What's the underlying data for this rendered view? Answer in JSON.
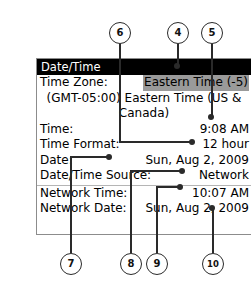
{
  "panel": {
    "title": "Date/Time",
    "rows": [
      {
        "label": "Time Zone:",
        "value": "Eastern Time (-5)",
        "highlighted": true
      },
      {
        "wrap_text": "(GMT-05:00) Eastern Time (US & Canada)"
      },
      {
        "label": "Time:",
        "value": "9:08 AM"
      },
      {
        "label": "Time Format:",
        "value": "12 hour"
      },
      {
        "label": "Date:",
        "value": "Sun, Aug 2, 2009"
      },
      {
        "label": "Date/Time Source:",
        "value": "Network"
      },
      {
        "divider": true
      },
      {
        "label": "Network Time:",
        "value": "10:07 AM"
      },
      {
        "label": "Network Date:",
        "value": "Sun, Aug 2, 2009"
      }
    ]
  },
  "callouts": [
    {
      "number": "6",
      "target": "time-format-value"
    },
    {
      "number": "4",
      "target": "panel-title-bar"
    },
    {
      "number": "5",
      "target": "time-zone-description"
    },
    {
      "number": "7",
      "target": "date-time-source-label"
    },
    {
      "number": "8",
      "target": "date-value"
    },
    {
      "number": "9",
      "target": "network-time-value"
    },
    {
      "number": "10",
      "target": "network-date-value"
    }
  ],
  "colors": {
    "title_bar_bg": "#000000",
    "title_bar_text": "#ffffff",
    "highlight_bg": "#9a9a9a",
    "panel_border": "#8c8c8c",
    "callout_stroke": "#2a2a2a"
  }
}
